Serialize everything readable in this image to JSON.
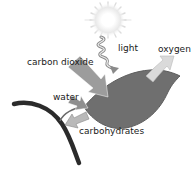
{
  "diagram": {
    "type": "photosynthesis",
    "labels": {
      "light": "light",
      "oxygen": "oxygen",
      "carbon_dioxide": "carbon dioxide",
      "water": "water",
      "carbohydrates": "carbohydrates"
    },
    "elements": [
      {
        "name": "sun",
        "role": "light source"
      },
      {
        "name": "light-wave",
        "role": "arrow from sun to leaf"
      },
      {
        "name": "leaf",
        "role": "photosynthesis site"
      },
      {
        "name": "branch",
        "role": "stem"
      },
      {
        "name": "carbon-dioxide-arrow",
        "direction": "in"
      },
      {
        "name": "water-arrow",
        "direction": "in"
      },
      {
        "name": "oxygen-arrow",
        "direction": "out"
      },
      {
        "name": "carbohydrates-arrow",
        "direction": "out"
      }
    ],
    "colors": {
      "leaf": "#6e6e6e",
      "branch": "#2a2a2a",
      "arrow_in": "#9a9a9a",
      "arrow_out": "#d8d8d8",
      "sun_core": "#ffffff",
      "sun_glow": "#e6e6e6"
    }
  }
}
